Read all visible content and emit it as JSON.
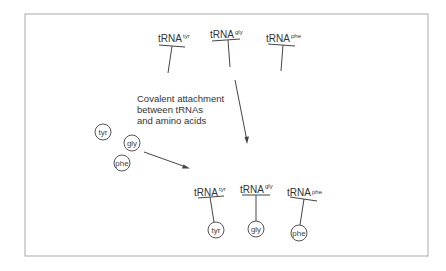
{
  "diagram": {
    "caption_lines": [
      "Covalent attachment",
      "between tRNAs",
      "and amino acids"
    ],
    "trna_base": "tRNA",
    "top_trnas": [
      {
        "name": "tRNA",
        "sup": "tyr"
      },
      {
        "name": "tRNA",
        "sup": "gly"
      },
      {
        "name": "tRNA",
        "sup": "phe"
      }
    ],
    "free_amino_acids": [
      "tyr",
      "gly",
      "phe"
    ],
    "charged_trnas": [
      {
        "name": "tRNA",
        "sup": "tyr",
        "amino_acid": "tyr"
      },
      {
        "name": "tRNA",
        "sup": "gly",
        "amino_acid": "gly"
      },
      {
        "name": "tRNA",
        "sup": "phe",
        "amino_acid": "phe"
      }
    ],
    "colors": {
      "line": "#444444",
      "frame": "#999999",
      "text": "#333333"
    }
  }
}
